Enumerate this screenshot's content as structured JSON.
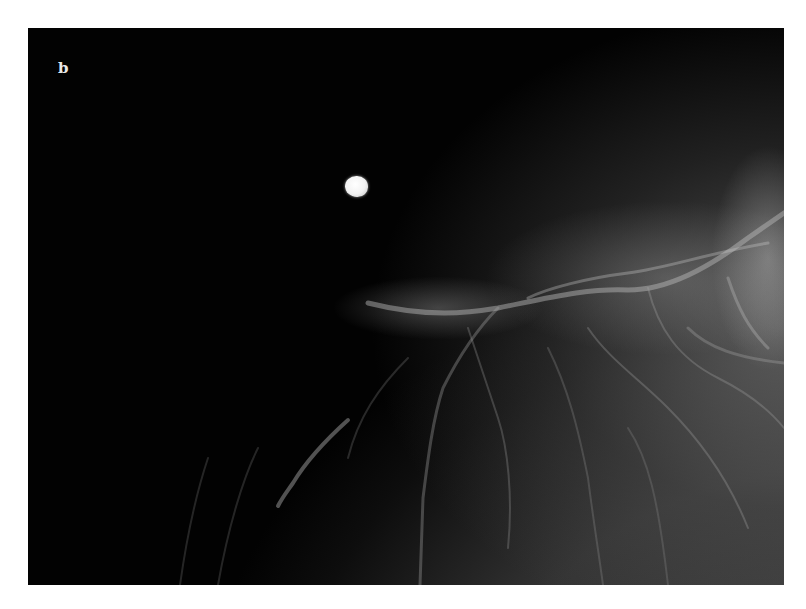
{
  "figure": {
    "panel_label": "b",
    "image_type": "mammogram-detail",
    "features": [
      {
        "name": "nodule",
        "description": "bright round dense opacity in fatty region"
      },
      {
        "name": "fibroglandular-tissue",
        "description": "fibrous strands and vessels toward lower right"
      }
    ],
    "colors": {
      "background": "#020202",
      "nodule": "#f2f2f2",
      "tissue": "#8a8a8a",
      "page": "#ffffff"
    }
  }
}
